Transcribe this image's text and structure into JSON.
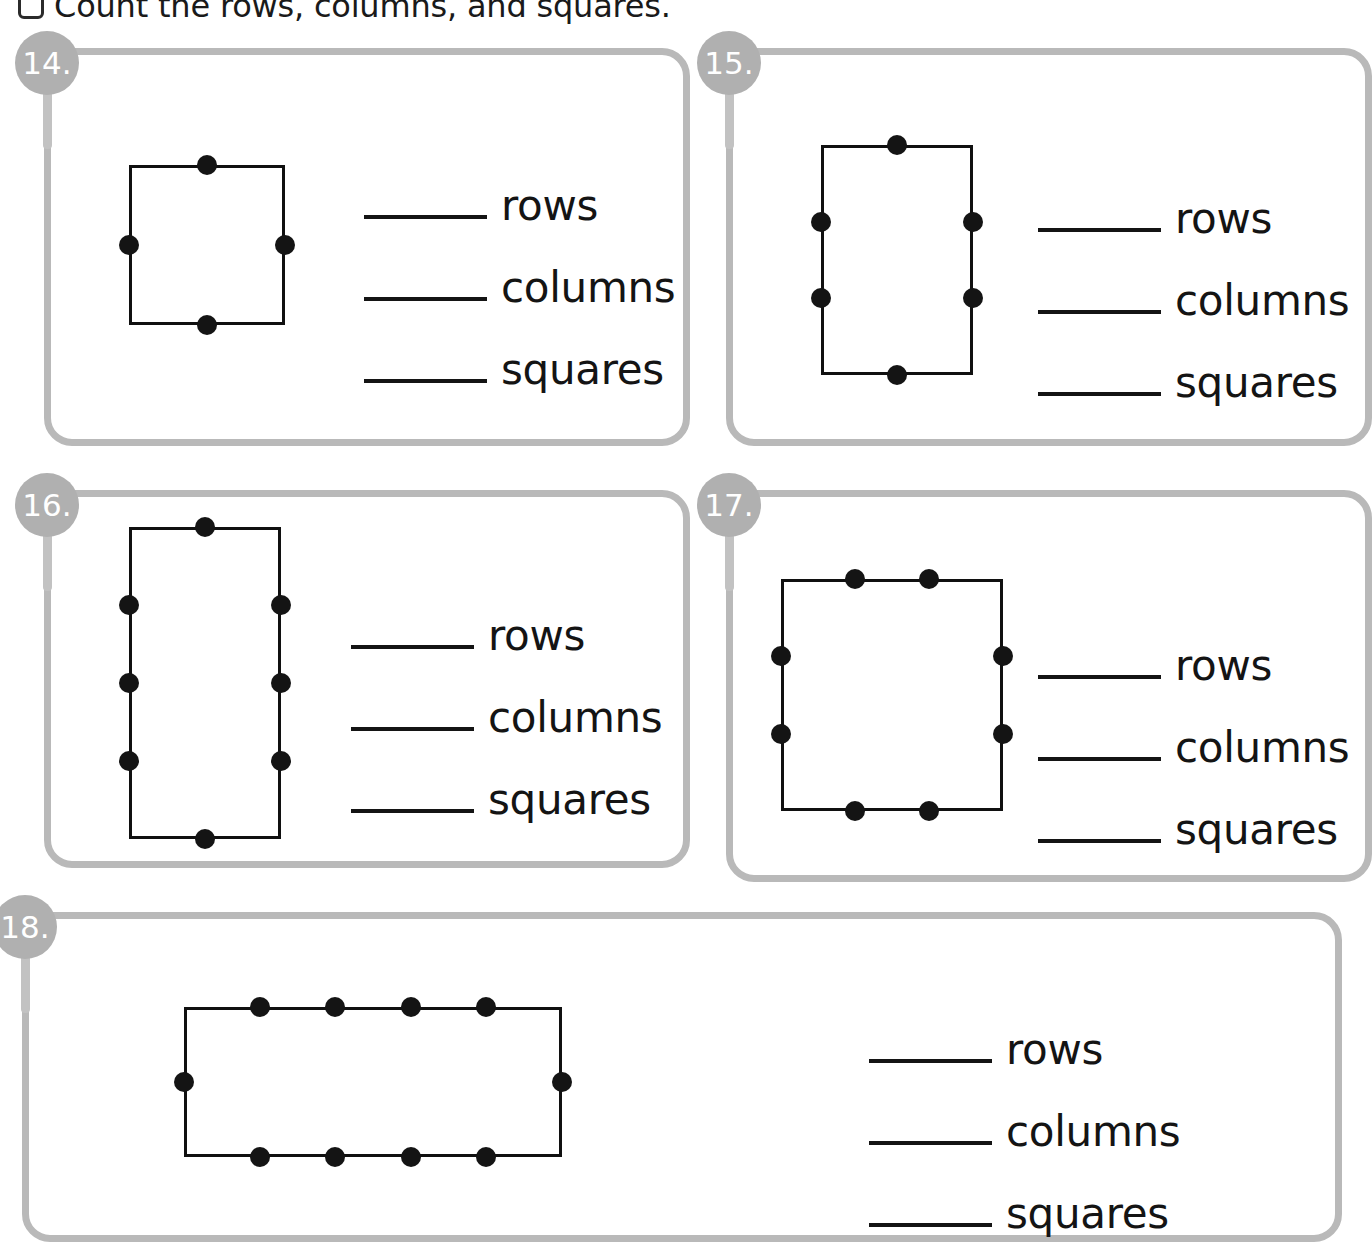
{
  "header": {
    "checkbox_icon": "checkbox-icon",
    "directive": "Count the rows, columns, and squares."
  },
  "answer_labels": {
    "rows": "rows",
    "columns": "columns",
    "squares": "squares"
  },
  "problems": [
    {
      "number": "14.",
      "figure": {
        "shape": "square",
        "dots_top": 1,
        "dots_bottom": 1,
        "dots_left": 1,
        "dots_right": 1,
        "rows": 2,
        "columns": 2
      },
      "blanks": [
        "",
        "",
        ""
      ]
    },
    {
      "number": "15.",
      "figure": {
        "shape": "rectangle-tall",
        "dots_top": 1,
        "dots_bottom": 1,
        "dots_left": 2,
        "dots_right": 2,
        "rows": 3,
        "columns": 2
      },
      "blanks": [
        "",
        "",
        ""
      ]
    },
    {
      "number": "16.",
      "figure": {
        "shape": "rectangle-tall",
        "dots_top": 1,
        "dots_bottom": 1,
        "dots_left": 3,
        "dots_right": 3,
        "rows": 4,
        "columns": 2
      },
      "blanks": [
        "",
        "",
        ""
      ]
    },
    {
      "number": "17.",
      "figure": {
        "shape": "square",
        "dots_top": 2,
        "dots_bottom": 2,
        "dots_left": 2,
        "dots_right": 2,
        "rows": 3,
        "columns": 3
      },
      "blanks": [
        "",
        "",
        ""
      ]
    },
    {
      "number": "18.",
      "figure": {
        "shape": "rectangle-wide",
        "dots_top": 4,
        "dots_bottom": 4,
        "dots_left": 1,
        "dots_right": 1,
        "rows": 2,
        "columns": 5
      },
      "blanks": [
        "",
        "",
        ""
      ]
    }
  ],
  "colors": {
    "card_border": "#b9b9b9",
    "badge_fill": "#b0b0b0",
    "badge_text": "#ffffff",
    "ink": "#141414",
    "page_background": "#ffffff"
  }
}
